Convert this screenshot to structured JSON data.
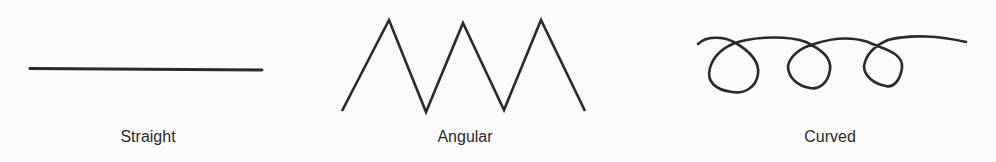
{
  "figures": [
    {
      "id": "straight",
      "label": "Straight",
      "label_x": 148
    },
    {
      "id": "angular",
      "label": "Angular",
      "label_x": 465
    },
    {
      "id": "curved",
      "label": "Curved",
      "label_x": 830
    }
  ],
  "colors": {
    "stroke": "#2a2a2a",
    "background": "#fbfbfb"
  }
}
